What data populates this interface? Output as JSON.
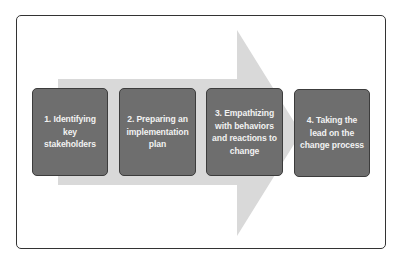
{
  "diagram": {
    "type": "process-flow",
    "direction": "left-to-right",
    "colors": {
      "frame_border": "#333333",
      "arrow_fill": "#d9d9d9",
      "step_fill": "#6e6e6e",
      "step_border": "#3c3c3c",
      "step_text": "#f2f2f2"
    },
    "steps": [
      {
        "label": "1. Identifying key stakeholders"
      },
      {
        "label": "2. Preparing an implementation plan"
      },
      {
        "label": "3. Empathizing with behaviors and reactions to change"
      },
      {
        "label": "4. Taking the lead on the change process"
      }
    ]
  }
}
